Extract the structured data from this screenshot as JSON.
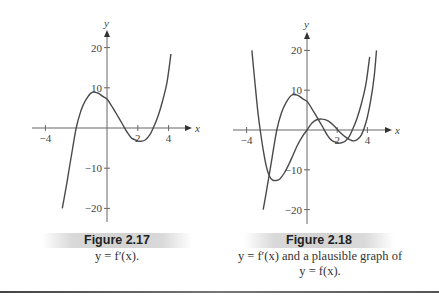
{
  "figures": [
    {
      "id": "fig217",
      "label": "Figure 2.17",
      "caption_lines": [
        "y = f′(x)."
      ]
    },
    {
      "id": "fig218",
      "label": "Figure 2.18",
      "caption_lines": [
        "y = f′(x) and a plausible graph of",
        "y = f(x)."
      ]
    }
  ],
  "chart_data": [
    {
      "type": "line",
      "title": "Figure 2.17",
      "subtitle": "y = f′(x).",
      "xlabel": "x",
      "ylabel": "y",
      "xlim": [
        -4.8,
        5.5
      ],
      "ylim": [
        -24,
        24
      ],
      "xticks": [
        -4,
        2,
        4
      ],
      "xtick_labels": [
        "−4",
        "2",
        "4"
      ],
      "yticks": [
        20,
        10,
        -10,
        -20
      ],
      "ytick_labels": [
        "20",
        "10",
        "−10",
        "−20"
      ],
      "grid": false,
      "legend": null,
      "series": [
        {
          "name": "f'(x)",
          "x": [
            -2.9,
            -2.6,
            -2.3,
            -2.0,
            -1.7,
            -1.4,
            -1.0,
            -0.6,
            -0.3,
            0.0,
            0.3,
            0.6,
            1.0,
            1.3,
            1.6,
            2.0,
            2.2,
            2.5,
            2.8,
            3.0,
            3.3,
            3.6,
            3.9,
            4.15
          ],
          "y": [
            -20,
            -13.5,
            -6.6,
            0,
            4.2,
            6.8,
            8.8,
            8.7,
            7.9,
            7.2,
            5.5,
            3.6,
            1.0,
            -1.0,
            -2.5,
            -3.2,
            -3.3,
            -2.9,
            -1.6,
            0,
            2.8,
            6.6,
            11.5,
            18.4
          ]
        }
      ]
    },
    {
      "type": "line",
      "title": "Figure 2.18",
      "subtitle": "y = f′(x) and a plausible graph of y = f(x).",
      "xlabel": "x",
      "ylabel": "y",
      "xlim": [
        -4.8,
        5.5
      ],
      "ylim": [
        -24,
        24
      ],
      "xticks": [
        -4,
        2,
        4
      ],
      "xtick_labels": [
        "−4",
        "2",
        "4"
      ],
      "yticks": [
        20,
        10,
        -10,
        -20
      ],
      "ytick_labels": [
        "20",
        "10",
        "−10",
        "−20"
      ],
      "grid": false,
      "legend": null,
      "series": [
        {
          "name": "f'(x)",
          "x": [
            -2.9,
            -2.6,
            -2.3,
            -2.0,
            -1.7,
            -1.4,
            -1.0,
            -0.6,
            -0.3,
            0.0,
            0.3,
            0.6,
            1.0,
            1.3,
            1.6,
            2.0,
            2.2,
            2.5,
            2.8,
            3.0,
            3.3,
            3.6,
            3.9,
            4.15
          ],
          "y": [
            -20,
            -13.5,
            -6.6,
            0,
            4.2,
            6.8,
            8.8,
            8.7,
            7.9,
            7.2,
            5.5,
            3.6,
            1.0,
            -1.0,
            -2.5,
            -3.2,
            -3.3,
            -2.9,
            -1.6,
            0,
            2.8,
            6.6,
            11.5,
            18.4
          ]
        },
        {
          "name": "f(x)",
          "x": [
            -3.65,
            -3.45,
            -3.25,
            -3.1,
            -2.9,
            -2.7,
            -2.5,
            -2.3,
            -2.05,
            -1.8,
            -1.5,
            -1.2,
            -0.9,
            -0.6,
            -0.3,
            0.0,
            0.3,
            0.6,
            1.0,
            1.4,
            1.8,
            2.2,
            2.6,
            3.0,
            3.3,
            3.6,
            3.9,
            4.2,
            4.45,
            4.6
          ],
          "y": [
            20,
            12,
            4.5,
            0,
            -5,
            -9,
            -11.5,
            -12.5,
            -12.7,
            -12.3,
            -10.8,
            -8.6,
            -6.1,
            -3.6,
            -1.6,
            0,
            1.6,
            2.5,
            2.75,
            2.3,
            1.0,
            -0.6,
            -1.9,
            -2.7,
            -2.5,
            -1.2,
            1.8,
            7.0,
            13.5,
            20
          ]
        }
      ]
    }
  ]
}
